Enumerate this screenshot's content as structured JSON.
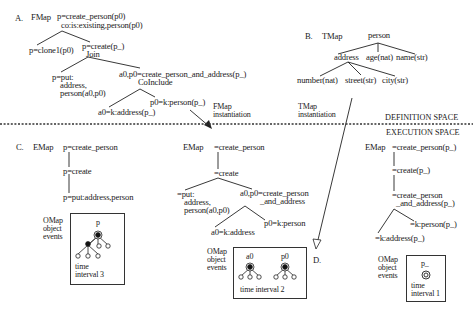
{
  "figure": {
    "spaces": {
      "definition": "DEFINITION SPACE",
      "execution": "EXECUTION SPACE"
    },
    "panel_a": {
      "letter": "A.",
      "map_label": "FMap",
      "root_line1": "p=create_person(p0)",
      "root_line2": "co:is:existing,person(p0)",
      "left_child": "p=clone1(p0)",
      "right_child_line1": "p=create(p_)",
      "right_child_line2": "Join",
      "join_left_line1": "p=put:",
      "join_left_line2": "address,",
      "join_left_line3": "person(a0,p0)",
      "join_right_line1": "a0,p0=create_person_and_address(p_)",
      "join_right_line2": "CoInclude",
      "coinclude_left": "a0=k:address(p_)",
      "coinclude_right": "p0=k:person(p_)",
      "instantiation_label_line1": "FMap",
      "instantiation_label_line2": "instantiation"
    },
    "panel_b": {
      "letter": "B.",
      "map_label": "TMap",
      "root": "person",
      "level1": [
        "address",
        "age(nat)",
        "name(str)"
      ],
      "level2": [
        "number(nat)",
        "street(str)",
        "city(str)"
      ],
      "instantiation_label_line1": "TMap",
      "instantiation_label_line2": "instantiation"
    },
    "panel_c": {
      "letter": "C.",
      "left": {
        "map_label": "EMap",
        "nodes": [
          "p=create_person",
          "p=create",
          "p=put:address,person"
        ],
        "omap_label_line1": "OMap",
        "omap_label_line2": "object",
        "omap_label_line3": "events",
        "omap_node_label": "p",
        "time_line1": "time",
        "time_line2": "interval 3"
      },
      "middle": {
        "map_label": "EMap",
        "root": "=create_person",
        "child": "=create",
        "left_line1": "=put:",
        "left_line2": "address,",
        "left_line3": "person(a0,p0)",
        "right_line1": "a0,p0=create_person",
        "right_line2": "_and_address",
        "leaf_left": "a0=k:address",
        "leaf_right": "p0=k:person",
        "omap_label_line1": "OMap",
        "omap_label_line2": "object",
        "omap_label_line3": "events",
        "omap_nodes": [
          "a0",
          "p0"
        ],
        "time_label": "time interval 2"
      }
    },
    "panel_d": {
      "letter": "D.",
      "map_label": "EMap",
      "nodes": [
        "=create_person(p_)",
        "=create(p_)"
      ],
      "node3_line1": "=create_person",
      "node3_line2": "_and_address(p_)",
      "leaf_right": "=k:person(p_)",
      "leaf_left": "=k:address(p_)",
      "omap_label_line1": "OMap",
      "omap_label_line2": "object",
      "omap_label_line3": "events",
      "omap_node_label": "p_",
      "time_line1": "time",
      "time_line2": "interval 1"
    }
  }
}
